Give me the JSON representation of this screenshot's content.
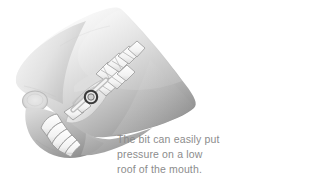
{
  "illustration": {
    "name": "horse-head-bit-cross-section",
    "title": "Cross-section of horse head showing bit against roof of mouth",
    "palette": {
      "background": "#ffffff",
      "head_light": "#f2f2f2",
      "head_mid": "#c9c9c9",
      "head_dark": "#8f8f8f",
      "head_shadow": "#6e6e6e",
      "tooth_light": "#fbfbfb",
      "tooth_outline": "#9a9a9a",
      "bit_ring": "#3a3a3a",
      "text_gray": "#8c8c8c"
    },
    "parts": [
      {
        "name": "head-silhouette",
        "label": "Horse head profile"
      },
      {
        "name": "nostril-marking",
        "label": "Nostril marking"
      },
      {
        "name": "upper-molars",
        "label": "Upper molar teeth"
      },
      {
        "name": "lower-molars",
        "label": "Lower molar teeth"
      },
      {
        "name": "lower-incisors",
        "label": "Lower incisor teeth"
      },
      {
        "name": "tongue",
        "label": "Tongue"
      },
      {
        "name": "bit-ring",
        "label": "Bit ring"
      },
      {
        "name": "palate",
        "label": "Low roof of the mouth"
      }
    ]
  },
  "caption": {
    "line1": "The bit can easily put",
    "line2": "pressure on a low",
    "line3": "roof of the mouth."
  }
}
